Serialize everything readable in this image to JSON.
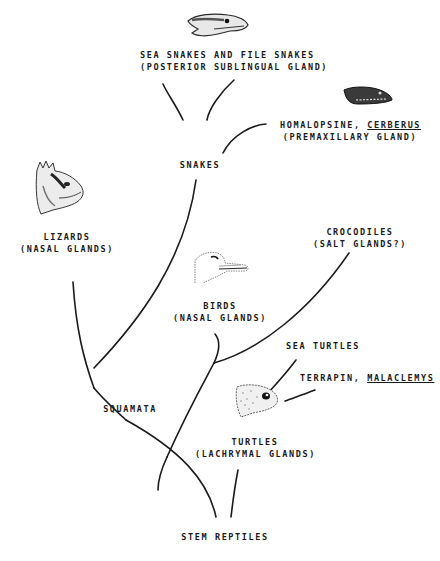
{
  "diagram": {
    "root": {
      "label": "STEM REPTILES"
    },
    "nodes": {
      "squamata": {
        "label": "SQUAMATA"
      },
      "snakes": {
        "label": "SNAKES"
      }
    },
    "taxa": {
      "sea_snakes": {
        "label": "SEA SNAKES AND FILE SNAKES",
        "gland": "(POSTERIOR SUBLINGUAL GLAND)",
        "icon": "snake-head-icon"
      },
      "homalopsine": {
        "label_prefix": "HOMALOPSINE, ",
        "label_genus": "CERBERUS",
        "gland": "(PREMAXILLARY GLAND)",
        "icon": "snake-head-icon"
      },
      "lizards": {
        "label": "LIZARDS",
        "gland": "(NASAL GLANDS)",
        "icon": "iguana-head-icon"
      },
      "birds": {
        "label": "BIRDS",
        "gland": "(NASAL GLANDS)",
        "icon": "bird-head-icon"
      },
      "crocodiles": {
        "label": "CROCODILES",
        "gland": "(SALT GLANDS?)"
      },
      "sea_turtles": {
        "label": "SEA TURTLES"
      },
      "terrapin": {
        "label_prefix": "TERRAPIN, ",
        "label_genus": "MALACLEMYS"
      },
      "turtles": {
        "label": "TURTLES",
        "gland": "(LACHRYMAL GLANDS)",
        "icon": "turtle-head-icon"
      }
    },
    "colors": {
      "ink": "#1a1a1a",
      "paper": "#ffffff"
    }
  }
}
